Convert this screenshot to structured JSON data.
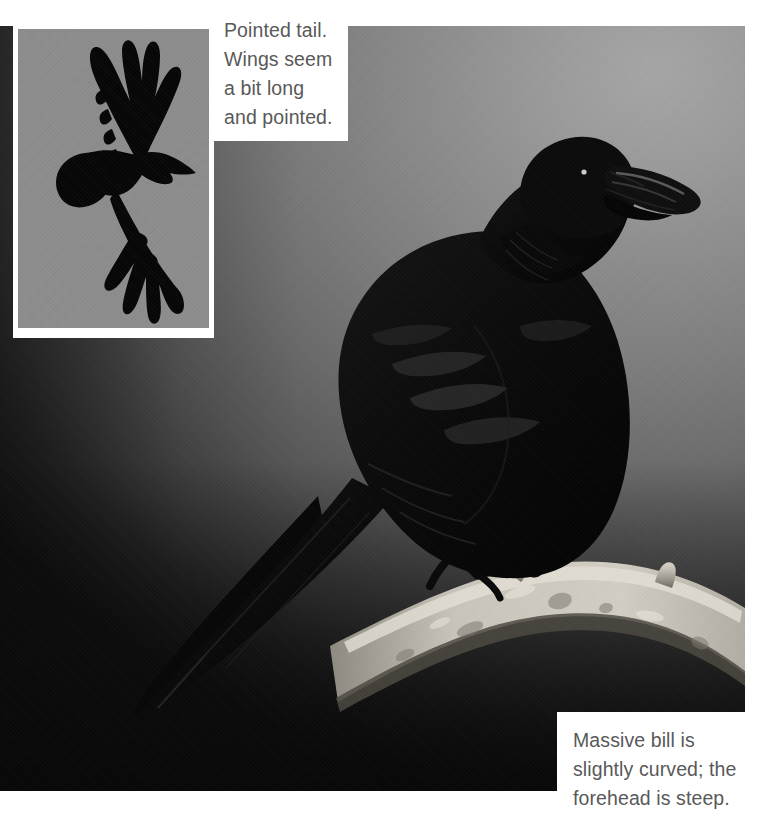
{
  "plate": {
    "subject": "Common Raven",
    "background_color": "#8a8a8a",
    "caption_text_color": "#595959",
    "photo_frame_color": "#ffffff"
  },
  "inset": {
    "name": "flight-silhouette-inset",
    "subject": "raven in flight, underside silhouette",
    "background_color": "#8d8d8d",
    "silhouette_color": "#060606"
  },
  "main_photo": {
    "name": "perched-raven-photograph",
    "subject": "Common Raven perched on a bare branch",
    "bird_color": "#080808",
    "branch_color": "#b9b5ac"
  },
  "captions": {
    "top": {
      "id": "caption-pointed-tail",
      "text": "Pointed tail.\nWings seem\na bit long\nand pointed."
    },
    "bottom": {
      "id": "caption-massive-bill",
      "text": "Massive bill is\nslightly curved; the\nforehead is steep."
    }
  }
}
